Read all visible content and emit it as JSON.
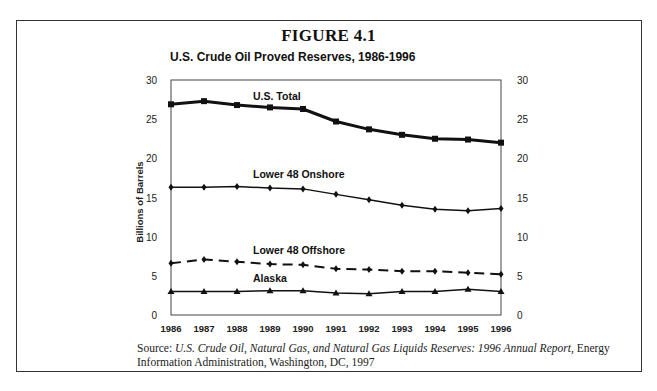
{
  "figure": {
    "label": "FIGURE 4.1",
    "title": "U.S. Crude Oil Proved Reserves, 1986-1996",
    "source_prefix": "Source: ",
    "source_title": "U.S. Crude Oil, Natural Gas, and Natural Gas Liquids Reserves: 1996 Annual Report",
    "source_rest": ", Energy Information Administration, Washington, DC, 1997"
  },
  "chart_data": {
    "type": "line",
    "title": "U.S. Crude Oil Proved Reserves, 1986-1996",
    "xlabel": "",
    "ylabel": "Billions of Barrels",
    "ylim": [
      0,
      30
    ],
    "yticks": [
      0,
      5,
      10,
      15,
      20,
      25,
      30
    ],
    "secondary_yticks": [
      0,
      5,
      10,
      15,
      20,
      25,
      30
    ],
    "grid": false,
    "legend": "inline labels",
    "categories": [
      "1986",
      "1987",
      "1988",
      "1989",
      "1990",
      "1991",
      "1992",
      "1993",
      "1994",
      "1995",
      "1996"
    ],
    "series": [
      {
        "name": "U.S. Total",
        "style": "solid-thick",
        "marker": "square",
        "values": [
          26.9,
          27.3,
          26.8,
          26.5,
          26.3,
          24.7,
          23.7,
          23.0,
          22.5,
          22.4,
          22.0
        ]
      },
      {
        "name": "Lower 48 Onshore",
        "style": "solid",
        "marker": "diamond",
        "values": [
          16.3,
          16.3,
          16.4,
          16.2,
          16.1,
          15.4,
          14.7,
          14.0,
          13.5,
          13.3,
          13.6
        ]
      },
      {
        "name": "Lower 48 Offshore",
        "style": "dashed",
        "marker": "diamond",
        "values": [
          6.6,
          7.1,
          6.8,
          6.5,
          6.4,
          5.9,
          5.8,
          5.6,
          5.6,
          5.4,
          5.2
        ]
      },
      {
        "name": "Alaska",
        "style": "solid",
        "marker": "triangle",
        "values": [
          3.0,
          3.0,
          3.0,
          3.1,
          3.1,
          2.8,
          2.7,
          3.0,
          3.0,
          3.3,
          3.0
        ]
      }
    ],
    "annotations": [
      {
        "text": "U.S. Total",
        "x": "1989",
        "y": 28.0
      },
      {
        "text": "Lower 48 Onshore",
        "x": "1989",
        "y": 18.0
      },
      {
        "text": "Lower 48 Offshore",
        "x": "1989",
        "y": 8.3
      },
      {
        "text": "Alaska",
        "x": "1989",
        "y": 4.7
      }
    ]
  },
  "colors": {
    "line": "#111111",
    "frame": "#333333",
    "background": "#ffffff"
  }
}
